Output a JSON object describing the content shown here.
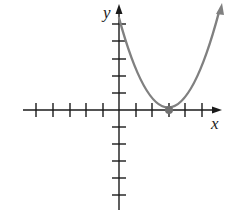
{
  "graph": {
    "x_axis_label": "x",
    "y_axis_label": "y",
    "x_ticks": [
      -5,
      -4,
      -3,
      -2,
      -1,
      1,
      2,
      3,
      4,
      5
    ],
    "y_ticks": [
      -5,
      -4,
      -3,
      -2,
      -1,
      1,
      2,
      3,
      4,
      5
    ],
    "curve": {
      "type": "parabola",
      "vertex": [
        3,
        0
      ],
      "direction": "opens upward",
      "color": "#808080"
    },
    "vertex_point": {
      "x": 3,
      "y": 0,
      "color": "#707070"
    },
    "axis_color": "#1a1a1a"
  }
}
